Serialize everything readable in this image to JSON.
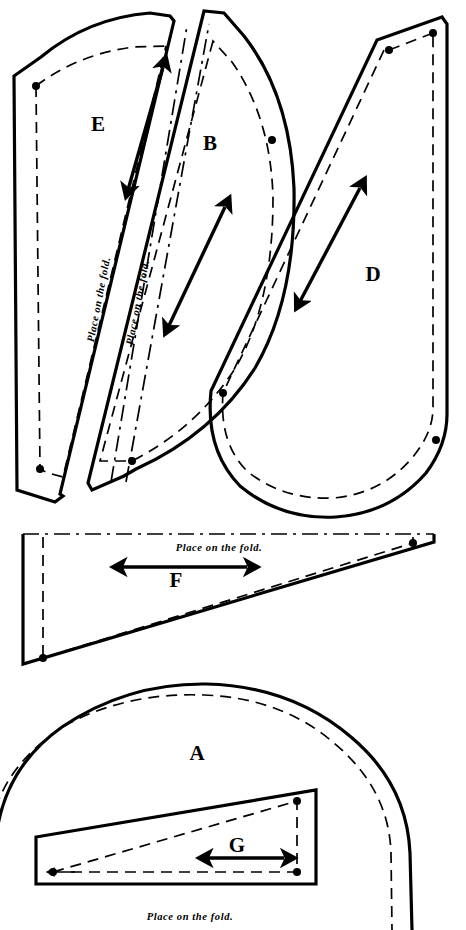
{
  "document": {
    "type": "sewing-pattern-cutting-layout",
    "background_color": "#ffffff",
    "line_color": "#000000",
    "width": 466,
    "height": 930
  },
  "labels": {
    "piece_a": "A",
    "piece_b": "B",
    "piece_d": "D",
    "piece_e": "E",
    "piece_f": "F",
    "piece_g": "G"
  },
  "fold_notes": {
    "e_fold": "Place on the fold.",
    "b_fold": "Place on the fold.",
    "f_fold": "Place on the fold.",
    "a_fold": "Place on the fold."
  },
  "pieces": [
    {
      "id": "E",
      "label": "E",
      "label_x": 98,
      "label_y": 131,
      "cut_path": "M 14 75 L 17 490 L 55 502 L 62 497 L 60 495 L 173 20 L 172 17 L 150 14 Q 88 18 41 57 Z",
      "seam_path": "M 36 85 L 40 470 L 47 473 L 61 476 L 163 47 Q 108 48 66 73 Z",
      "dots": [
        [
          36,
          85
        ],
        [
          40,
          470
        ]
      ],
      "grain_arrow": {
        "x1": 126,
        "y1": 197,
        "x2": 163,
        "y2": 67
      },
      "fold_line": {
        "x1": 108,
        "y1": 480,
        "x2": 186,
        "y2": 26
      },
      "fold_text": "Place on the fold.",
      "fold_text_x": 102,
      "fold_text_y": 300,
      "fold_text_rotation": -79
    },
    {
      "id": "B",
      "label": "B",
      "label_x": 210,
      "label_y": 150,
      "cut_path": "M 203 12 L 88 485 L 90 489 L 122 475 L 133 470 Q 210 438 254 372 Q 297 298 295 188 Q 292 96 245 37 L 222 12 Z",
      "seam_path": "M 211 40 L 99 462 L 130 462 Q 196 429 235 368 Q 272 305 272 200 Q 270 120 231 62 Z",
      "dots": [
        [
          130,
          462
        ],
        [
          272,
          140
        ]
      ],
      "grain_arrow": {
        "x1": 165,
        "y1": 334,
        "x2": 225,
        "y2": 207
      },
      "fold_line": {
        "x1": 124,
        "y1": 481,
        "x2": 208,
        "y2": 24
      },
      "fold_text": "Place on the fold.",
      "fold_text_x": 140,
      "fold_text_y": 303,
      "fold_text_rotation": -79
    },
    {
      "id": "D",
      "label": "D",
      "label_x": 373,
      "label_y": 281,
      "cut_path": "M 440 18 L 376 39 L 210 392 Q 206 450 239 486 Q 280 519 335 516 Q 390 512 425 473 Q 446 444 447 414 L 447 25 Z",
      "seam_path": "M 432 34 L 388 50 L 385 48 L 222 394 Q 219 444 247 472 Q 283 500 332 498 Q 380 494 411 458 Q 432 433 432 409 Z",
      "dots": [
        [
          388,
          50
        ],
        [
          432,
          34
        ],
        [
          222,
          394
        ],
        [
          435,
          440
        ]
      ],
      "grain_arrow": {
        "x1": 296,
        "y1": 309,
        "x2": 360,
        "y2": 188
      }
    },
    {
      "id": "F",
      "label": "F",
      "label_x": 176,
      "label_y": 583,
      "cut_path": "M 22 536 L 22 663 L 433 541 L 433 536 Z",
      "seam_path": "M 42 540 L 42 658 L 412 543",
      "fold_line": {
        "x1": 22,
        "y1": 536,
        "x2": 433,
        "y2": 536
      },
      "dots": [
        [
          42,
          658
        ],
        [
          412,
          543
        ]
      ],
      "grain_arrow": {
        "x1": 111,
        "y1": 566,
        "x2": 246,
        "y2": 566
      },
      "fold_text": "Place on the fold.",
      "fold_text_x": 218,
      "fold_text_y": 550
    },
    {
      "id": "A",
      "label": "A",
      "label_x": 197,
      "label_y": 753,
      "cut_path": "M 0 835 Q 6 770 60 730 Q 125 684 205 684 Q 290 684 350 734 Q 406 780 410 851 L 412 930",
      "seam_path": "M 0 806 Q 12 764 62 728 Q 124 694 202 696 Q 280 698 332 742 Q 388 788 390 851 L 392 930",
      "fold_text": "Place on the fold.",
      "fold_text_x": 188,
      "fold_text_y": 918
    },
    {
      "id": "G",
      "label": "G",
      "label_x": 237,
      "label_y": 845,
      "cut_path": "M 35 838 L 35 884 L 315 884 L 315 790 Z",
      "seam_path": "M 52 873 L 297 873 L 297 800 Z",
      "dots": [
        [
          52,
          873
        ],
        [
          297,
          873
        ],
        [
          297,
          800
        ]
      ],
      "grain_arrow": {
        "x1": 198,
        "y1": 858,
        "x2": 283,
        "y2": 858
      }
    }
  ]
}
